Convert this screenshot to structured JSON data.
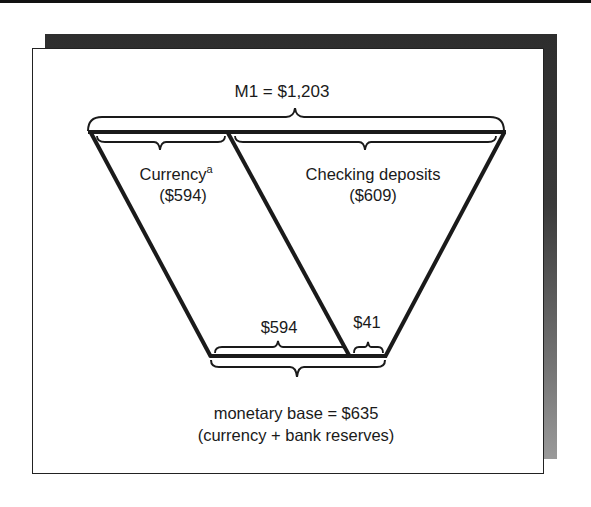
{
  "diagram": {
    "title": "M1 = $1,203",
    "currency": {
      "label": "Currency",
      "footnote_mark": "a",
      "value": "($594)"
    },
    "checking": {
      "label": "Checking deposits",
      "value": "($609)"
    },
    "base_parts": {
      "currency_value": "$594",
      "reserves_value": "$41"
    },
    "base": {
      "label": "monetary base = $635",
      "sublabel": "(currency + bank reserves)"
    },
    "colors": {
      "ink": "#1a1a1a",
      "shadow": "#333333",
      "background": "#ffffff"
    }
  }
}
